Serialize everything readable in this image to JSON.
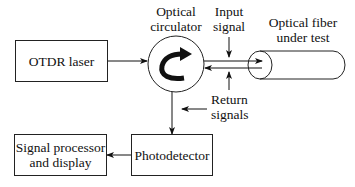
{
  "diagram": {
    "blocks": {
      "laser": "OTDR laser",
      "circulator_line1": "Optical",
      "circulator_line2": "circulator",
      "fiber_line1": "Optical fiber",
      "fiber_line2": "under test",
      "photodetector": "Photodetector",
      "processor_line1": "Signal processor",
      "processor_line2": "and display"
    },
    "labels": {
      "input_line1": "Input",
      "input_line2": "signal",
      "return_top_line1": "Return",
      "return_top_line2": "signals"
    },
    "connections": [
      {
        "from": "OTDR laser",
        "to": "Optical circulator"
      },
      {
        "from": "Optical circulator",
        "to": "Optical fiber under test",
        "label": "Input signal"
      },
      {
        "from": "Optical fiber under test",
        "to": "Optical circulator",
        "label": "Return signals"
      },
      {
        "from": "Optical circulator",
        "to": "Photodetector"
      },
      {
        "from": "Photodetector",
        "to": "Signal processor and display"
      }
    ]
  }
}
